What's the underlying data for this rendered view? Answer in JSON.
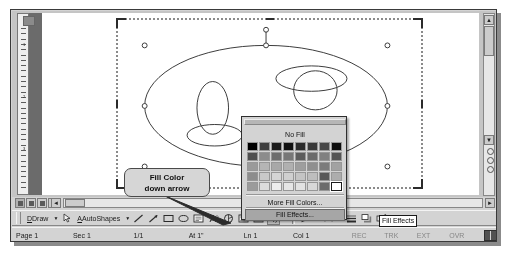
{
  "app": {
    "name": "Microsoft Word drawing canvas"
  },
  "callout": {
    "line1": "Fill Color",
    "line2": "down arrow"
  },
  "dropdown": {
    "name": "fill-color-dropdown",
    "no_fill_label": "No Fill",
    "more_colors_label": "More Fill Colors...",
    "fill_effects_label": "Fill Effects...",
    "grid_rows": 5,
    "grid_cols": 8,
    "swatches": [
      [
        "#000000",
        "#3f3f3f",
        "#1a1a1a",
        "#111111",
        "#2b2b2b",
        "#3a3a3a",
        "#474747",
        "#0d0d0d"
      ],
      [
        "#4f4f4f",
        "#8c8c8c",
        "#6e6e6e",
        "#777777",
        "#5c5c5c",
        "#6a6a6a",
        "#808080",
        "#555555"
      ],
      [
        "#9a9a9a",
        "#b5b5b5",
        "#a8a8a8",
        "#b0b0b0",
        "#9e9e9e",
        "#8f8f8f",
        "#7c7c7c",
        "#a2a2a2"
      ],
      [
        "#8d8d8d",
        "#c9c9c9",
        "#d4d4d4",
        "#cfcfcf",
        "#c4c4c4",
        "#bdbdbd",
        "#585858",
        "#adadad"
      ],
      [
        "#9b9b9b",
        "#dcdcdc",
        "#ededed",
        "#e6e6e6",
        "#e2e2e2",
        "#d8d8d8",
        "#6c6c6c",
        "#ffffff"
      ]
    ],
    "selected_index": {
      "row": 4,
      "col": 7
    }
  },
  "toolbar": {
    "name": "drawing-toolbar",
    "draw_label": "Draw",
    "autoshapes_label": "AutoShapes",
    "buttons": [
      {
        "name": "select-objects-icon",
        "glyph": "select"
      },
      {
        "name": "line-icon",
        "glyph": "line"
      },
      {
        "name": "arrow-icon",
        "glyph": "arrow"
      },
      {
        "name": "rectangle-icon",
        "glyph": "rect"
      },
      {
        "name": "oval-icon",
        "glyph": "oval"
      },
      {
        "name": "text-box-icon",
        "glyph": "textbox"
      },
      {
        "name": "insert-wordart-icon",
        "glyph": "wordart"
      },
      {
        "name": "insert-diagram-icon",
        "glyph": "diagram"
      },
      {
        "name": "insert-clip-art-icon",
        "glyph": "clipart"
      },
      {
        "name": "insert-picture-icon",
        "glyph": "picture"
      },
      {
        "name": "fill-color-icon",
        "glyph": "bucket"
      },
      {
        "name": "line-color-icon",
        "glyph": "pen"
      },
      {
        "name": "font-color-icon",
        "glyph": "fontcolor"
      },
      {
        "name": "line-style-icon",
        "glyph": "linestyle"
      },
      {
        "name": "shadow-style-icon",
        "glyph": "shadow"
      },
      {
        "name": "3d-style-icon",
        "glyph": "threed"
      }
    ],
    "tooltip": "Fill Effects"
  },
  "statusbar": {
    "name": "status-bar",
    "page": "Page 1",
    "section": "Sec 1",
    "pages": "1/1",
    "at": "At 1\"",
    "line": "Ln 1",
    "column": "Col 1",
    "rec": "REC",
    "trk": "TRK",
    "ext": "EXT",
    "ovr": "OVR"
  },
  "ruler": {
    "name": "vertical-ruler",
    "marks": [
      "1",
      "2",
      "3"
    ]
  },
  "scrollbars": {
    "vertical_up": "▲",
    "vertical_down": "▼",
    "horizontal_left": "◄",
    "horizontal_right": "►",
    "prev_page": "◆",
    "select_browse": "●",
    "next_page": "◆"
  },
  "view_tabs": [
    {
      "name": "view-normal",
      "active": true
    },
    {
      "name": "view-web-layout",
      "active": false
    },
    {
      "name": "view-print-layout",
      "active": false
    },
    {
      "name": "view-outline",
      "active": false
    }
  ],
  "canvas": {
    "name": "drawing-canvas",
    "shapes": [
      {
        "name": "large-ellipse",
        "type": "ellipse"
      },
      {
        "name": "small-ellipse-left",
        "type": "ellipse"
      },
      {
        "name": "flat-ellipse-left",
        "type": "ellipse"
      },
      {
        "name": "small-ellipse-right",
        "type": "ellipse"
      },
      {
        "name": "flat-ellipse-right",
        "type": "ellipse"
      }
    ],
    "selection_handles": 8,
    "rotate_handle": true
  }
}
